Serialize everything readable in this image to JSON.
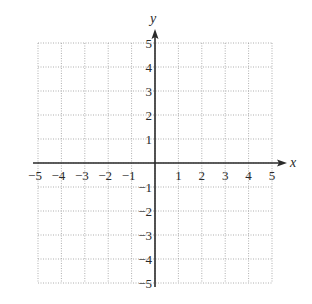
{
  "chart_data": {
    "type": "coordinate-grid",
    "title": "",
    "xlabel": "x",
    "ylabel": "y",
    "xlim": [
      -5,
      5
    ],
    "ylim": [
      -5,
      5
    ],
    "grid": true,
    "grid_style": "dotted",
    "x_ticks": [
      -5,
      -4,
      -3,
      -2,
      -1,
      1,
      2,
      3,
      4,
      5
    ],
    "y_ticks": [
      -5,
      -4,
      -3,
      -2,
      -1,
      1,
      2,
      3,
      4,
      5
    ],
    "x_tick_labels": [
      "−5",
      "−4",
      "−3",
      "−2",
      "−1",
      "1",
      "2",
      "3",
      "4",
      "5"
    ],
    "y_tick_labels": [
      "−5",
      "−4",
      "−3",
      "−2",
      "−1",
      "1",
      "2",
      "3",
      "4",
      "5"
    ],
    "series": [],
    "colors": {
      "axis": "#2a2a2a",
      "grid": "#9a9a9a",
      "text": "#2a2a2a"
    }
  },
  "axes": {
    "x_label": "x",
    "y_label": "y"
  }
}
